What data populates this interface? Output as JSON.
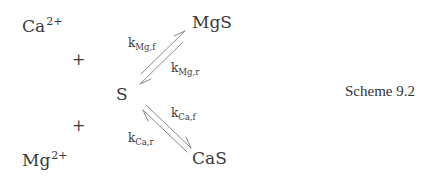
{
  "scheme": {
    "caption": "Scheme 9.2",
    "species": {
      "ca_ion": {
        "base": "Ca",
        "charge": "2+"
      },
      "mg_ion": {
        "base": "Mg",
        "charge": "2+"
      },
      "s": {
        "label": "S"
      },
      "mgs": {
        "label": "MgS"
      },
      "cas": {
        "label": "CaS"
      }
    },
    "plus_signs": [
      "+",
      "+"
    ],
    "rates": {
      "mg_forward": {
        "base": "k",
        "sub": "Mg,f"
      },
      "mg_reverse": {
        "base": "k",
        "sub": "Mg,r"
      },
      "ca_forward": {
        "base": "k",
        "sub": "Ca,f"
      },
      "ca_reverse": {
        "base": "k",
        "sub": "Ca,r"
      }
    },
    "reactions": [
      {
        "from": "S",
        "to": "MgS",
        "forward_rate": "k_Mg,f",
        "reverse_rate": "k_Mg,r"
      },
      {
        "from": "S",
        "to": "CaS",
        "forward_rate": "k_Ca,f",
        "reverse_rate": "k_Ca,r"
      }
    ],
    "colors": {
      "text": "#3a3a3a",
      "arrow": "#8a8a8a"
    }
  }
}
